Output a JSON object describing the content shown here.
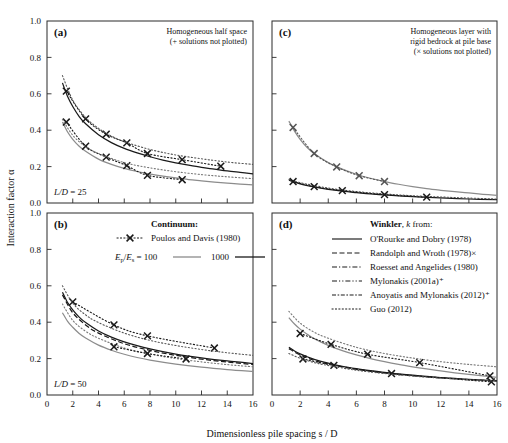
{
  "figure": {
    "x_axis_title": "Dimensionless pile spacing s / D",
    "y_axis_title": "Interaction factor α",
    "x_ticks": [
      0,
      2,
      4,
      6,
      8,
      10,
      12,
      14,
      16
    ],
    "y_ticks": [
      "0.0",
      "0.2",
      "0.4",
      "0.6",
      "0.8",
      "1.0"
    ],
    "xlim": [
      0,
      16
    ],
    "ylim": [
      0,
      1
    ]
  },
  "panels": {
    "a": {
      "tag": "(a)",
      "header": [
        "Homogeneous half space",
        "(+ solutions not plotted)"
      ],
      "annotation": "L/D = 25"
    },
    "b": {
      "tag": "(b)",
      "annotation": "L/D = 50"
    },
    "c": {
      "tag": "(c)",
      "header": [
        "Homogeneous layer with",
        "rigid bedrock at pile base",
        "(× solutions not plotted)"
      ]
    },
    "d": {
      "tag": "(d)"
    }
  },
  "legend_continuum": {
    "title": "Continuum:",
    "marker_label": "Poulos and Davis (1980)",
    "ratio_label": "Eₚ/Eₛ = 100",
    "ratio_value_2": "1000"
  },
  "legend_winkler": {
    "title": "Winkler, k from:",
    "entries": [
      {
        "label": "O'Rourke and Dobry (1978)",
        "style": "solid"
      },
      {
        "label": "Randolph and Wroth (1978)×",
        "style": "dashed"
      },
      {
        "label": "Roesset and Angelides (1980)",
        "style": "dashdot"
      },
      {
        "label": "Mylonakis (2001a)⁺",
        "style": "dashdotdot"
      },
      {
        "label": "Anoyatis and Mylonakis (2012)⁺",
        "style": "dashdash"
      },
      {
        "label": "Guo (2012)",
        "style": "dotted"
      }
    ]
  },
  "colors": {
    "black": "#1a1a1a",
    "gray": "#8c8c8c",
    "frame": "#2b2b2b"
  },
  "chart_data": {
    "type": "line",
    "xlabel": "Dimensionless pile spacing s / D",
    "ylabel": "Interaction factor α",
    "xlim": [
      0,
      16
    ],
    "ylim": [
      0,
      1
    ],
    "grid": false,
    "legend_position": "panel-b-and-d",
    "panels": [
      {
        "panel": "a",
        "condition": "Homogeneous half space, L/D = 25",
        "series": [
          {
            "name": "Ep/Es = 1000 continuum solid",
            "style": "solid",
            "color": "#1a1a1a",
            "x": [
              1.2,
              1.6,
              2,
              2.5,
              3,
              4,
              5,
              6,
              7,
              8,
              9,
              10,
              11,
              12,
              13,
              14,
              15,
              16
            ],
            "y": [
              0.66,
              0.585,
              0.53,
              0.475,
              0.435,
              0.375,
              0.332,
              0.3,
              0.275,
              0.254,
              0.236,
              0.221,
              0.208,
              0.196,
              0.186,
              0.176,
              0.168,
              0.16
            ]
          },
          {
            "name": "Ep/Es = 1000 Poulos and Davis markers",
            "style": "dotted-with-x",
            "color": "#1a1a1a",
            "x": [
              1.5,
              3.0,
              4.6,
              6.2,
              7.8,
              10.5,
              13.5
            ],
            "y": [
              0.615,
              0.462,
              0.378,
              0.33,
              0.272,
              0.238,
              0.202
            ]
          },
          {
            "name": "Ep/Es = 1000 dotted envelope",
            "style": "dotted",
            "color": "#555555",
            "x": [
              1.2,
              2,
              3,
              4,
              5,
              6,
              8,
              10,
              12,
              14,
              16
            ],
            "y": [
              0.7,
              0.565,
              0.47,
              0.41,
              0.368,
              0.337,
              0.294,
              0.264,
              0.243,
              0.225,
              0.212
            ]
          },
          {
            "name": "Ep/Es = 100 continuum solid",
            "style": "solid",
            "color": "#8c8c8c",
            "x": [
              1.2,
              1.6,
              2,
              2.5,
              3,
              4,
              5,
              6,
              7,
              8,
              9,
              10,
              11,
              12,
              13,
              14,
              15,
              16
            ],
            "y": [
              0.445,
              0.39,
              0.35,
              0.312,
              0.284,
              0.241,
              0.212,
              0.19,
              0.173,
              0.159,
              0.148,
              0.138,
              0.129,
              0.122,
              0.115,
              0.109,
              0.104,
              0.099
            ]
          },
          {
            "name": "Ep/Es = 100 Poulos and Davis markers",
            "style": "dotted-with-x",
            "color": "#1a1a1a",
            "x": [
              1.5,
              3.0,
              4.6,
              6.2,
              7.8,
              10.5
            ],
            "y": [
              0.445,
              0.312,
              0.252,
              0.205,
              0.152,
              0.128
            ]
          },
          {
            "name": "Ep/Es = 100 dotted envelope",
            "style": "dotted",
            "color": "#777777",
            "x": [
              1.2,
              2,
              3,
              4,
              6,
              8,
              10,
              12,
              14,
              16
            ],
            "y": [
              0.46,
              0.372,
              0.31,
              0.272,
              0.222,
              0.193,
              0.172,
              0.156,
              0.144,
              0.134
            ]
          }
        ]
      },
      {
        "panel": "b",
        "condition": "Homogeneous half space, L/D = 50",
        "series": [
          {
            "name": "Ep/Es = 1000 solid black",
            "style": "solid",
            "color": "#1a1a1a",
            "x": [
              1.2,
              1.6,
              2,
              2.5,
              3,
              4,
              5,
              6,
              7,
              8,
              9,
              10,
              11,
              12,
              13,
              14,
              15,
              16
            ],
            "y": [
              0.565,
              0.508,
              0.468,
              0.428,
              0.398,
              0.352,
              0.318,
              0.292,
              0.271,
              0.253,
              0.238,
              0.225,
              0.214,
              0.204,
              0.195,
              0.187,
              0.18,
              0.173
            ]
          },
          {
            "name": "Winkler dashed bundle",
            "style": "dashed",
            "color": "#1a1a1a",
            "x": [
              1.2,
              2,
              3,
              4,
              6,
              8,
              10,
              12,
              14,
              16
            ],
            "y": [
              0.55,
              0.452,
              0.385,
              0.34,
              0.282,
              0.245,
              0.218,
              0.197,
              0.181,
              0.168
            ]
          },
          {
            "name": "Poulos and Davis markers",
            "style": "dotted-with-x",
            "color": "#1a1a1a",
            "x": [
              2.0,
              5.2,
              7.8,
              13.0
            ],
            "y": [
              0.512,
              0.385,
              0.325,
              0.258
            ]
          },
          {
            "name": "upper dotted envelope",
            "style": "dotted",
            "color": "#555555",
            "x": [
              1.2,
              2,
              3,
              4,
              6,
              8,
              10,
              12,
              14,
              16
            ],
            "y": [
              0.6,
              0.505,
              0.44,
              0.398,
              0.34,
              0.3,
              0.272,
              0.25,
              0.232,
              0.218
            ]
          },
          {
            "name": "Ep/Es = 100 solid gray",
            "style": "solid",
            "color": "#8c8c8c",
            "x": [
              1.2,
              1.6,
              2,
              2.5,
              3,
              4,
              5,
              6,
              7,
              8,
              10,
              12,
              14,
              16
            ],
            "y": [
              0.452,
              0.405,
              0.372,
              0.338,
              0.313,
              0.274,
              0.246,
              0.224,
              0.206,
              0.192,
              0.17,
              0.153,
              0.14,
              0.13
            ]
          },
          {
            "name": "lower dotted envelope",
            "style": "dotted",
            "color": "#777777",
            "x": [
              1.2,
              2,
              3,
              4,
              6,
              8,
              10,
              12,
              14,
              16
            ],
            "y": [
              0.5,
              0.41,
              0.35,
              0.312,
              0.258,
              0.225,
              0.2,
              0.182,
              0.167,
              0.155
            ]
          },
          {
            "name": "lower markers",
            "style": "dotted-with-x",
            "color": "#1a1a1a",
            "x": [
              5.2,
              7.8,
              10.8
            ],
            "y": [
              0.265,
              0.228,
              0.198
            ]
          }
        ]
      },
      {
        "panel": "c",
        "condition": "Homogeneous layer with rigid bedrock at pile base",
        "series": [
          {
            "name": "gray upper curve",
            "style": "solid",
            "color": "#8c8c8c",
            "x": [
              1.2,
              1.6,
              2,
              2.5,
              3,
              4,
              5,
              6,
              7,
              8,
              9,
              10,
              11,
              12,
              13,
              14,
              15,
              16
            ],
            "y": [
              0.45,
              0.395,
              0.35,
              0.305,
              0.272,
              0.222,
              0.186,
              0.158,
              0.136,
              0.118,
              0.103,
              0.09,
              0.079,
              0.07,
              0.062,
              0.055,
              0.048,
              0.042
            ]
          },
          {
            "name": "gray curve markers",
            "style": "dotted-with-x",
            "color": "#555555",
            "x": [
              1.5,
              3.0,
              4.6,
              6.2,
              8.0
            ],
            "y": [
              0.415,
              0.272,
              0.198,
              0.15,
              0.118
            ]
          },
          {
            "name": "lower dense bundle",
            "style": "solid",
            "color": "#1a1a1a",
            "x": [
              1.2,
              2,
              3,
              4,
              5,
              6,
              7,
              8,
              10,
              12,
              14,
              16
            ],
            "y": [
              0.125,
              0.105,
              0.088,
              0.075,
              0.065,
              0.057,
              0.05,
              0.044,
              0.035,
              0.028,
              0.022,
              0.018
            ]
          },
          {
            "name": "lower bundle dotted",
            "style": "dotted",
            "color": "#555555",
            "x": [
              1.2,
              2,
              4,
              6,
              8,
              10,
              12,
              14,
              16
            ],
            "y": [
              0.13,
              0.112,
              0.082,
              0.063,
              0.05,
              0.04,
              0.033,
              0.027,
              0.022
            ]
          },
          {
            "name": "lower bundle markers",
            "style": "dotted-with-x",
            "color": "#1a1a1a",
            "x": [
              1.5,
              3.0,
              5.0,
              8.0,
              11.0
            ],
            "y": [
              0.118,
              0.09,
              0.068,
              0.046,
              0.032
            ]
          }
        ]
      },
      {
        "panel": "d",
        "condition": "Homogeneous layer with rigid bedrock, deeper pile",
        "series": [
          {
            "name": "gray upper curve",
            "style": "solid",
            "color": "#8c8c8c",
            "x": [
              1.2,
              1.6,
              2,
              2.5,
              3,
              4,
              5,
              6,
              7,
              8,
              9,
              10,
              11,
              12,
              13,
              14,
              15,
              16
            ],
            "y": [
              0.425,
              0.39,
              0.362,
              0.334,
              0.31,
              0.273,
              0.244,
              0.22,
              0.2,
              0.183,
              0.168,
              0.155,
              0.143,
              0.132,
              0.122,
              0.113,
              0.105,
              0.097
            ]
          },
          {
            "name": "gray curve markers",
            "style": "dotted-with-x",
            "color": "#1a1a1a",
            "x": [
              2.0,
              4.2,
              6.8,
              10.5,
              15.5
            ],
            "y": [
              0.338,
              0.278,
              0.224,
              0.178,
              0.105
            ]
          },
          {
            "name": "upper dotted envelope",
            "style": "dotted",
            "color": "#777777",
            "x": [
              1.2,
              2,
              3,
              4,
              6,
              8,
              10,
              12,
              14,
              16
            ],
            "y": [
              0.46,
              0.395,
              0.345,
              0.312,
              0.262,
              0.228,
              0.203,
              0.183,
              0.168,
              0.155
            ]
          },
          {
            "name": "black Winkler bundle",
            "style": "solid",
            "color": "#1a1a1a",
            "x": [
              1.2,
              1.6,
              2,
              2.5,
              3,
              4,
              5,
              6,
              7,
              8,
              9,
              10,
              11,
              12,
              13,
              14,
              15,
              16
            ],
            "y": [
              0.262,
              0.242,
              0.226,
              0.21,
              0.196,
              0.175,
              0.158,
              0.145,
              0.134,
              0.124,
              0.116,
              0.109,
              0.102,
              0.096,
              0.091,
              0.086,
              0.082,
              0.078
            ]
          },
          {
            "name": "black bundle dashed",
            "style": "dashed",
            "color": "#1a1a1a",
            "x": [
              1.2,
              2,
              3,
              4,
              6,
              8,
              10,
              12,
              14,
              16
            ],
            "y": [
              0.255,
              0.22,
              0.19,
              0.17,
              0.141,
              0.121,
              0.106,
              0.094,
              0.085,
              0.077
            ]
          },
          {
            "name": "lower markers",
            "style": "dotted-with-x",
            "color": "#1a1a1a",
            "x": [
              2.2,
              4.4,
              8.5,
              15.6
            ],
            "y": [
              0.198,
              0.163,
              0.118,
              0.072
            ]
          },
          {
            "name": "lower dotted",
            "style": "dotted",
            "color": "#555555",
            "x": [
              1.2,
              2,
              3,
              4,
              6,
              8,
              10,
              12,
              14,
              16
            ],
            "y": [
              0.228,
              0.202,
              0.178,
              0.162,
              0.136,
              0.118,
              0.104,
              0.093,
              0.084,
              0.077
            ]
          }
        ]
      }
    ]
  }
}
